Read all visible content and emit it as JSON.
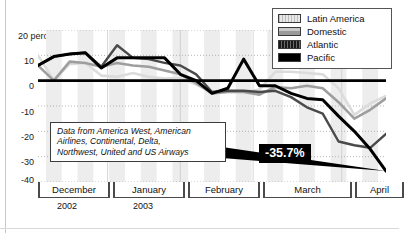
{
  "chart_data": {
    "type": "line",
    "title": "",
    "subtitle": "",
    "xlabel": "",
    "ylabel": "",
    "ylim": [
      -40,
      20
    ],
    "yticks": [
      20,
      10,
      0,
      -10,
      -20,
      -30,
      -40
    ],
    "ytick_labels": [
      "20 percent",
      "10",
      "0",
      "-10",
      "-20",
      "-30",
      "-40"
    ],
    "grid": true,
    "legend_position": "top-right",
    "x_axis_type": "weekly periods grouped by month",
    "x_categories": [
      "December",
      "January",
      "February",
      "March",
      "April"
    ],
    "x_year_labels": [
      "2002",
      "2003"
    ],
    "x": [
      0,
      1,
      2,
      3,
      4,
      5,
      6,
      7,
      8,
      9,
      10,
      11,
      12,
      13,
      14,
      15,
      16,
      17,
      18,
      19,
      20,
      21,
      22
    ],
    "series": [
      {
        "name": "Latin America",
        "color": "#dcdcdc",
        "values": [
          10.0,
          0.2,
          6.5,
          7.0,
          2.0,
          1.5,
          3.0,
          1.5,
          0.8,
          1.0,
          -1.5,
          -4.5,
          -4.0,
          -4.5,
          -3.5,
          3.5,
          3.5,
          3.0,
          2.5,
          -3.0,
          -13.5,
          -9.0,
          -6.0
        ]
      },
      {
        "name": "Domestic",
        "color": "#9e9e9e",
        "values": [
          6.0,
          0.0,
          7.5,
          7.0,
          5.5,
          7.0,
          6.0,
          5.5,
          4.0,
          2.5,
          -1.0,
          -5.0,
          -4.5,
          -4.5,
          -5.5,
          -2.5,
          -3.0,
          -2.0,
          -3.0,
          -8.5,
          -15.0,
          -11.5,
          -7.0
        ]
      },
      {
        "name": "Atlantic",
        "color": "#4a4a4a",
        "values": [
          6.0,
          9.5,
          10.5,
          11.0,
          5.5,
          14.0,
          9.0,
          8.5,
          7.0,
          6.0,
          2.5,
          -4.5,
          -4.0,
          -4.0,
          -4.5,
          -4.0,
          -6.5,
          -10.5,
          -13.0,
          -24.0,
          -25.5,
          -26.5,
          -21.0
        ]
      },
      {
        "name": "Pacific",
        "color": "#000000",
        "values": [
          6.0,
          9.5,
          10.5,
          11.0,
          5.0,
          9.0,
          9.0,
          9.0,
          9.0,
          2.5,
          0.0,
          -5.0,
          -3.0,
          8.5,
          -2.0,
          -2.0,
          -5.0,
          -7.0,
          -7.5,
          -14.0,
          -20.0,
          -27.0,
          -35.7
        ]
      }
    ],
    "annotations": [
      {
        "name": "data-source-note",
        "text": "Data from America West, American Airlines, Continental, Delta, Northwest, United and US Airways"
      },
      {
        "name": "pacific-low-callout",
        "text": "-35.7%",
        "series": "Pacific",
        "value": -35.7
      }
    ]
  },
  "legend": {
    "items": [
      {
        "label": "Latin America",
        "swatch": "latin-america-swatch"
      },
      {
        "label": "Domestic",
        "swatch": "domestic-swatch"
      },
      {
        "label": "Atlantic",
        "swatch": "atlantic-swatch"
      },
      {
        "label": "Pacific",
        "swatch": "pacific-swatch"
      }
    ]
  },
  "yaxis": {
    "t20": "20 percent",
    "t10": "10",
    "t0": "0",
    "tm10": "-10",
    "tm20": "-20",
    "tm30": "-30",
    "tm40": "-40"
  },
  "xaxis": {
    "months": [
      "December",
      "January",
      "February",
      "March",
      "April"
    ],
    "years": [
      "2002",
      "2003"
    ]
  },
  "note": {
    "line1": "Data from America West, American",
    "line2": "Airlines, Continental, Delta,",
    "line3": "Northwest, United and US Airways"
  },
  "callout": {
    "value": "-35.7%"
  }
}
